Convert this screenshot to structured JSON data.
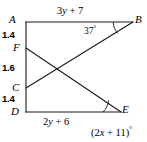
{
  "figure": {
    "type": "geometry-diagram",
    "stroke_color": "#1a1a1a",
    "background_color": "#ffffff",
    "vertices": [
      {
        "name": "A",
        "label": "A",
        "x": 26,
        "y": 22
      },
      {
        "name": "B",
        "label": "B",
        "x": 133,
        "y": 22
      },
      {
        "name": "F",
        "label": "F",
        "x": 26,
        "y": 48
      },
      {
        "name": "C",
        "label": "C",
        "x": 26,
        "y": 88
      },
      {
        "name": "D",
        "label": "D",
        "x": 26,
        "y": 112
      },
      {
        "name": "E",
        "label": "E",
        "x": 120,
        "y": 112
      }
    ],
    "segments": [
      {
        "name": "AB",
        "from": "A",
        "to": "B"
      },
      {
        "name": "AD",
        "from": "A",
        "to": "D"
      },
      {
        "name": "DE",
        "from": "D",
        "to": "E"
      },
      {
        "name": "FE",
        "from": "F",
        "to": "E"
      },
      {
        "name": "CB",
        "from": "C",
        "to": "B"
      }
    ],
    "measures": [
      {
        "name": "AF",
        "value": "1.4"
      },
      {
        "name": "FC",
        "value": "1.6"
      },
      {
        "name": "CD",
        "value": "1.4"
      }
    ],
    "edge_labels": {
      "top": {
        "text": "3y + 7",
        "var": "y",
        "coef": 3,
        "const": 7,
        "segment": "AB"
      },
      "bottom": {
        "text": "2y + 6",
        "var": "y",
        "coef": 2,
        "const": 6,
        "segment": "DE"
      }
    },
    "angles": [
      {
        "name": "angle-B",
        "at": "B",
        "text": "37",
        "unit": "°",
        "full_text": "37°"
      },
      {
        "name": "angle-E",
        "at": "E",
        "text": "(2x + 11)",
        "unit": "°",
        "full_text": "(2x + 11)°"
      }
    ]
  }
}
